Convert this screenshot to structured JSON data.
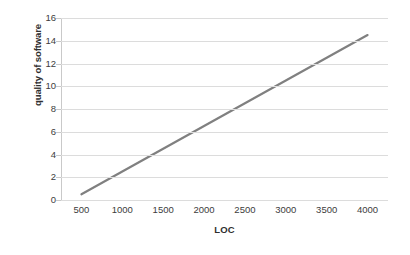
{
  "chart_data": {
    "type": "line",
    "title": "",
    "xlabel": "LOC",
    "ylabel": "quality of software",
    "xlim": [
      250,
      4250
    ],
    "ylim": [
      0,
      16
    ],
    "grid": "horizontal",
    "legend": "none",
    "x_ticks": [
      500,
      1000,
      1500,
      2000,
      2500,
      3000,
      3500,
      4000
    ],
    "y_ticks": [
      0,
      2,
      4,
      6,
      8,
      10,
      12,
      14,
      16
    ],
    "x_tick_labels": [
      "500",
      "1000",
      "1500",
      "2000",
      "2500",
      "3000",
      "3500",
      "4000"
    ],
    "y_tick_labels": [
      "0",
      "2",
      "4",
      "6",
      "8",
      "10",
      "12",
      "14",
      "16"
    ],
    "series": [
      {
        "name": "quality of software",
        "color": "#808080",
        "line_width": 2.2,
        "markers": "none",
        "x": [
          500,
          1000,
          1500,
          2000,
          2500,
          3000,
          3500,
          4000
        ],
        "values": [
          0.5,
          2.5,
          4.5,
          6.5,
          8.5,
          10.5,
          12.5,
          14.5
        ]
      }
    ]
  },
  "axes": {
    "y_title": "quality of software",
    "x_title": "LOC"
  },
  "style": {
    "background": "#ffffff",
    "gridline_color": "#dcdcdc",
    "axis_color": "#c9c9c9",
    "tick_text_color": "#3c3c3c",
    "title_text_color": "#2f2f2f",
    "series_color": "#808080"
  }
}
